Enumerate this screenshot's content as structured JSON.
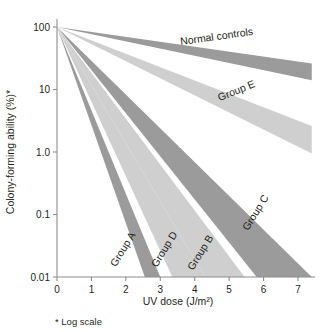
{
  "chart_data": {
    "type": "area",
    "title": "",
    "xlabel": "UV dose (J/m²)",
    "ylabel": "Colony-forming ability (%)*",
    "footnote": "* Log scale",
    "yscale": "log",
    "ylim": [
      0.01,
      100
    ],
    "xlim": [
      0,
      7.4
    ],
    "grid": false,
    "legend_position": "inline-labels",
    "x_ticks": [
      "0",
      "1",
      "2",
      "3",
      "4",
      "5",
      "6",
      "7"
    ],
    "x_tick_values": [
      0,
      1,
      2,
      3,
      4,
      5,
      6,
      7
    ],
    "y_ticks": [
      "100",
      "10",
      "1.0",
      "0.1",
      "0.01"
    ],
    "y_tick_values": [
      100,
      10,
      1,
      0.1,
      0.01
    ],
    "series": [
      {
        "name": "Normal controls",
        "color": "#9b9b9b",
        "shade": "medium-gray",
        "start_x": 0,
        "start_y": 100,
        "upper_end_x": 7.4,
        "upper_end_y": 26,
        "lower_end_x": 7.4,
        "lower_end_y": 14,
        "label": "Normal controls",
        "label_x": 4.65,
        "label_y": 62,
        "label_rotation": -8
      },
      {
        "name": "Group E",
        "color": "#cfcfcf",
        "shade": "light-gray",
        "start_x": 0,
        "start_y": 100,
        "upper_end_x": 7.4,
        "upper_end_y": 2.6,
        "lower_end_x": 7.4,
        "lower_end_y": 0.95,
        "label": "Group E",
        "label_x": 5.25,
        "label_y": 8.5,
        "label_rotation": -22
      },
      {
        "name": "Group C",
        "color": "#9b9b9b",
        "shade": "medium-gray",
        "start_x": 0,
        "start_y": 100,
        "upper_end_x": 7.4,
        "upper_end_y": 0.01,
        "lower_end_x": 5.8,
        "lower_end_y": 0.01,
        "label": "Group C",
        "label_x": 5.85,
        "label_y": 0.1,
        "label_rotation": -58
      },
      {
        "name": "Group B",
        "color": "#cfcfcf",
        "shade": "light-gray",
        "start_x": 0,
        "start_y": 100,
        "upper_end_x": 5.45,
        "upper_end_y": 0.01,
        "lower_end_x": 4.3,
        "lower_end_y": 0.01,
        "label": "Group B",
        "label_x": 4.25,
        "label_y": 0.023,
        "label_rotation": -58
      },
      {
        "name": "Group D",
        "color": "#cfcfcf",
        "shade": "light-gray",
        "start_x": 0,
        "start_y": 100,
        "upper_end_x": 4.3,
        "upper_end_y": 0.01,
        "lower_end_x": 3.35,
        "lower_end_y": 0.01,
        "label": "Group D",
        "label_x": 3.2,
        "label_y": 0.026,
        "label_rotation": -58
      },
      {
        "name": "Group A",
        "color": "#9b9b9b",
        "shade": "medium-gray",
        "start_x": 0,
        "start_y": 100,
        "upper_end_x": 3.0,
        "upper_end_y": 0.01,
        "lower_end_x": 2.55,
        "lower_end_y": 0.01,
        "label": "Group A",
        "label_x": 2.0,
        "label_y": 0.026,
        "label_rotation": -58
      }
    ]
  }
}
